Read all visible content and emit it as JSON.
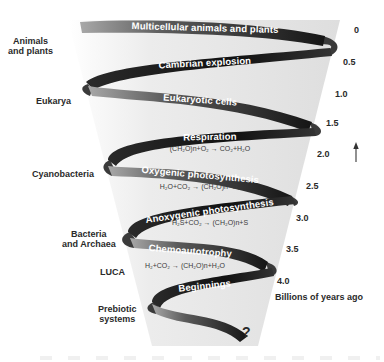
{
  "diagram": {
    "type": "helical timeline of the evolution of life",
    "stages": [
      {
        "label": "Multicellular animals and plants",
        "equation": ""
      },
      {
        "label": "Cambrian explosion",
        "equation": ""
      },
      {
        "label": "Eukaryotic cells",
        "equation": ""
      },
      {
        "label": "Respiration",
        "equation": "(CH₂O)n+O₂ → CO₂+H₂O"
      },
      {
        "label": "Oxygenic photosynthesis",
        "equation": "H₂O+CO₂ → (CH₂O)n+O₂"
      },
      {
        "label": "Anoxygenic photosynthesis",
        "equation": "H₂S+CO₂ → (CH₂O)n+S"
      },
      {
        "label": "Chemoautotrophy",
        "equation": "H₂+CO₂ → (CH₂O)n+H₂O"
      },
      {
        "label": "Beginnings",
        "equation": ""
      }
    ],
    "origin_marker": "?",
    "groups": [
      {
        "label_line1": "Animals",
        "label_line2": "and plants"
      },
      {
        "label_line1": "Eukarya",
        "label_line2": ""
      },
      {
        "label_line1": "Cyanobacteria",
        "label_line2": ""
      },
      {
        "label_line1": "Bacteria",
        "label_line2": "and Archaea"
      },
      {
        "label_line1": "LUCA",
        "label_line2": ""
      },
      {
        "label_line1": "Prebiotic",
        "label_line2": "systems"
      }
    ],
    "time_axis": {
      "ticks": [
        "0",
        "0.5",
        "1.0",
        "1.5",
        "2.0",
        "2.5",
        "3.0",
        "3.5",
        "4.0"
      ],
      "title": "Billions of years ago",
      "direction_arrow": "up-arrow"
    },
    "colors": {
      "ribbon_dark": "#1a1a1a",
      "ribbon_light": "#9a9a9a",
      "funnel": "#e6e6e6",
      "text": "#2a2a2a"
    }
  }
}
